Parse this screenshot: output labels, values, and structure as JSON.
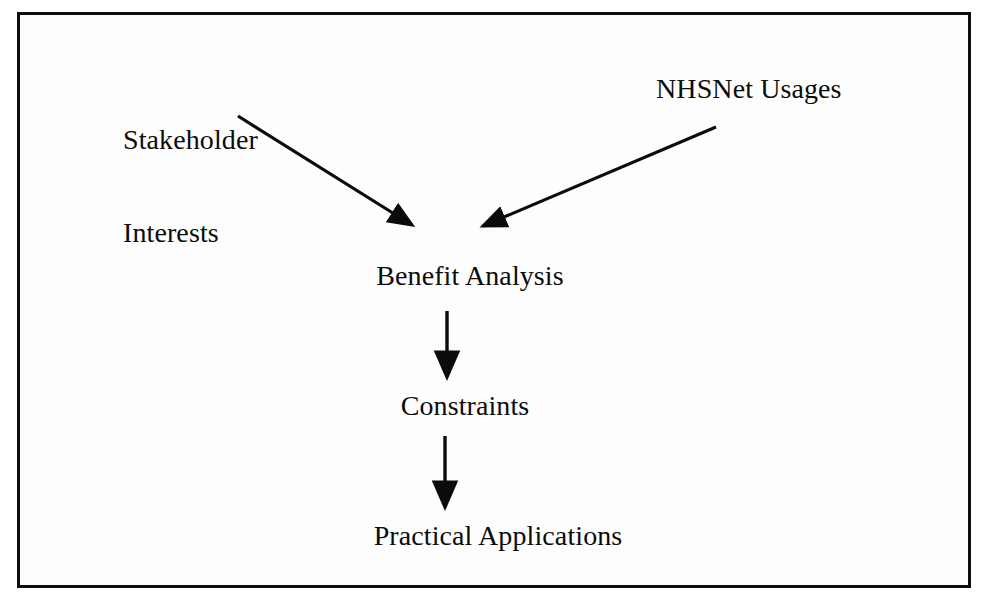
{
  "figure": {
    "type": "flow-diagram",
    "frame": {
      "border_color": "#0d0d0d",
      "background": "#fdfdfd"
    },
    "line_color": "#0b0b0b",
    "scan_artifact_text": "                                                                                                  "
  },
  "nodes": [
    {
      "id": "stakeholder-interests",
      "label_line1": "Stakeholder",
      "label_line2": "Interests",
      "label": "Stakeholder Interests"
    },
    {
      "id": "nhsnet-usages",
      "label": "NHSNet Usages"
    },
    {
      "id": "benefit-analysis",
      "label": "Benefit Analysis"
    },
    {
      "id": "constraints",
      "label": "Constraints"
    },
    {
      "id": "practical-applications",
      "label": "Practical Applications"
    }
  ],
  "edges": [
    {
      "id": "edge-stakeholder-to-benefit",
      "from": "stakeholder-interests",
      "to": "benefit-analysis",
      "style": "diagonal"
    },
    {
      "id": "edge-nhsnet-to-benefit",
      "from": "nhsnet-usages",
      "to": "benefit-analysis",
      "style": "diagonal"
    },
    {
      "id": "edge-benefit-to-constraints",
      "from": "benefit-analysis",
      "to": "constraints",
      "style": "vertical"
    },
    {
      "id": "edge-constraints-to-practical",
      "from": "constraints",
      "to": "practical-applications",
      "style": "vertical"
    }
  ]
}
